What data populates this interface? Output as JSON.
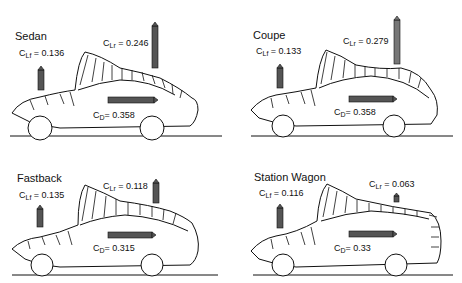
{
  "figure": {
    "panels": [
      {
        "title": "Sedan",
        "clf_label": "C",
        "clf_sub": "Lf",
        "clf_value": "= 0.136",
        "clr_label": "C",
        "clr_sub": "Lr",
        "clr_value": "= 0.246",
        "cd_label": "C",
        "cd_sub": "D",
        "cd_value": "= 0.358"
      },
      {
        "title": "Coupe",
        "clf_label": "C",
        "clf_sub": "Lf",
        "clf_value": "= 0.133",
        "clr_label": "C",
        "clr_sub": "Lr",
        "clr_value": "= 0.279",
        "cd_label": "C",
        "cd_sub": "D",
        "cd_value": "= 0.358"
      },
      {
        "title": "Fastback",
        "clf_label": "C",
        "clf_sub": "Lf",
        "clf_value": "= 0.135",
        "clr_label": "C",
        "clr_sub": "Lr",
        "clr_value": "= 0.118",
        "cd_label": "C",
        "cd_sub": "D",
        "cd_value": "= 0.315"
      },
      {
        "title": "Station Wagon",
        "clf_label": "C",
        "clf_sub": "Lf",
        "clf_value": "= 0.116",
        "clr_label": "C",
        "clr_sub": "Lr",
        "clr_value": "= 0.063",
        "cd_label": "C",
        "cd_sub": "D",
        "cd_value": "= 0.33"
      }
    ]
  },
  "colors": {
    "line": "#111111",
    "arrow_fill": "#555555",
    "background": "#ffffff"
  }
}
